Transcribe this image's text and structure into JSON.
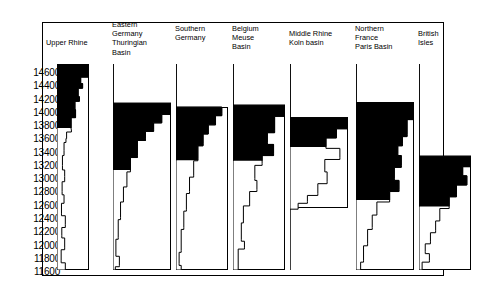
{
  "chart_data": {
    "type": "area",
    "title": "",
    "xlabel": "",
    "ylabel": "",
    "orientation": "vertical-columns",
    "y_axis": {
      "label": "",
      "unit": "calendar years BP",
      "direction": "descending-downwards",
      "ticks": [
        14600,
        14400,
        14200,
        14000,
        13800,
        13600,
        13400,
        13200,
        13000,
        12800,
        12600,
        12400,
        12200,
        12000,
        11800,
        11600
      ],
      "ylim": [
        14700,
        11550
      ],
      "grid": false
    },
    "legend": {
      "position": "none",
      "entries": []
    },
    "series": [
      {
        "name": "Upper Rhine",
        "label": "Upper Rhine",
        "profile": [
          {
            "y": 14700,
            "w": 1.0
          },
          {
            "y": 14560,
            "w": 1.0
          },
          {
            "y": 14500,
            "w": 0.74
          },
          {
            "y": 14400,
            "w": 0.8
          },
          {
            "y": 14330,
            "w": 0.66
          },
          {
            "y": 14200,
            "w": 0.7
          },
          {
            "y": 14130,
            "w": 0.56
          },
          {
            "y": 14000,
            "w": 0.58
          },
          {
            "y": 13880,
            "w": 0.44
          },
          {
            "y": 13700,
            "w": 0.45
          },
          {
            "y": 13660,
            "w": 0.3
          },
          {
            "y": 13560,
            "w": 0.28
          },
          {
            "y": 13500,
            "w": 0.22
          },
          {
            "y": 13380,
            "w": 0.22
          },
          {
            "y": 13300,
            "w": 0.17
          },
          {
            "y": 13150,
            "w": 0.17
          },
          {
            "y": 13080,
            "w": 0.24
          },
          {
            "y": 12980,
            "w": 0.24
          },
          {
            "y": 12900,
            "w": 0.16
          },
          {
            "y": 12750,
            "w": 0.16
          },
          {
            "y": 12700,
            "w": 0.22
          },
          {
            "y": 12620,
            "w": 0.22
          },
          {
            "y": 12570,
            "w": 0.14
          },
          {
            "y": 12420,
            "w": 0.14
          },
          {
            "y": 12380,
            "w": 0.26
          },
          {
            "y": 12250,
            "w": 0.26
          },
          {
            "y": 12200,
            "w": 0.15
          },
          {
            "y": 12080,
            "w": 0.15
          },
          {
            "y": 12040,
            "w": 0.24
          },
          {
            "y": 11900,
            "w": 0.24
          },
          {
            "y": 11860,
            "w": 0.13
          },
          {
            "y": 11700,
            "w": 0.13
          },
          {
            "y": 11660,
            "w": 0.26
          },
          {
            "y": 11550,
            "w": 0.26
          }
        ],
        "fill_above": 13720
      },
      {
        "name": "Eastern Germany Thuringian Basin",
        "label": "Eastern\nGermany\nThuringian\nBasin",
        "profile": [
          {
            "y": 14700,
            "w": 0.0
          },
          {
            "y": 14120,
            "w": 0.0
          },
          {
            "y": 14100,
            "w": 1.0
          },
          {
            "y": 13960,
            "w": 1.0
          },
          {
            "y": 13930,
            "w": 0.84
          },
          {
            "y": 13830,
            "w": 0.84
          },
          {
            "y": 13800,
            "w": 0.7
          },
          {
            "y": 13700,
            "w": 0.7
          },
          {
            "y": 13670,
            "w": 0.56
          },
          {
            "y": 13560,
            "w": 0.56
          },
          {
            "y": 13530,
            "w": 0.42
          },
          {
            "y": 13300,
            "w": 0.42
          },
          {
            "y": 13270,
            "w": 0.3
          },
          {
            "y": 13080,
            "w": 0.3
          },
          {
            "y": 13050,
            "w": 0.24
          },
          {
            "y": 12850,
            "w": 0.24
          },
          {
            "y": 12820,
            "w": 0.18
          },
          {
            "y": 12620,
            "w": 0.18
          },
          {
            "y": 12590,
            "w": 0.13
          },
          {
            "y": 12350,
            "w": 0.13
          },
          {
            "y": 12320,
            "w": 0.09
          },
          {
            "y": 12050,
            "w": 0.09
          },
          {
            "y": 12020,
            "w": 0.05
          },
          {
            "y": 11780,
            "w": 0.05
          },
          {
            "y": 11760,
            "w": 0.11
          },
          {
            "y": 11620,
            "w": 0.11
          },
          {
            "y": 11600,
            "w": 0.04
          },
          {
            "y": 11550,
            "w": 0.04
          }
        ],
        "fill_above": 13080
      },
      {
        "name": "Southern Germany",
        "label": "Southern\nGermany",
        "profile": [
          {
            "y": 14700,
            "w": 0.0
          },
          {
            "y": 14060,
            "w": 0.0
          },
          {
            "y": 14040,
            "w": 0.88
          },
          {
            "y": 13940,
            "w": 0.88
          },
          {
            "y": 13910,
            "w": 0.76
          },
          {
            "y": 13800,
            "w": 0.76
          },
          {
            "y": 13770,
            "w": 0.62
          },
          {
            "y": 13660,
            "w": 0.62
          },
          {
            "y": 13630,
            "w": 0.52
          },
          {
            "y": 13480,
            "w": 0.52
          },
          {
            "y": 13450,
            "w": 0.42
          },
          {
            "y": 13250,
            "w": 0.42
          },
          {
            "y": 13220,
            "w": 0.34
          },
          {
            "y": 13000,
            "w": 0.34
          },
          {
            "y": 12970,
            "w": 0.26
          },
          {
            "y": 12750,
            "w": 0.26
          },
          {
            "y": 12720,
            "w": 0.2
          },
          {
            "y": 12480,
            "w": 0.2
          },
          {
            "y": 12450,
            "w": 0.15
          },
          {
            "y": 12200,
            "w": 0.15
          },
          {
            "y": 12170,
            "w": 0.1
          },
          {
            "y": 11850,
            "w": 0.1
          },
          {
            "y": 11820,
            "w": 0.06
          },
          {
            "y": 11650,
            "w": 0.06
          },
          {
            "y": 11620,
            "w": 0.1
          },
          {
            "y": 11550,
            "w": 0.1
          }
        ],
        "fill_above": 13230
      },
      {
        "name": "Belgium Meuse Basin",
        "label": "Belgium\nMeuse\nBasin",
        "profile": [
          {
            "y": 14700,
            "w": 0.0
          },
          {
            "y": 14090,
            "w": 0.0
          },
          {
            "y": 14070,
            "w": 1.0
          },
          {
            "y": 13930,
            "w": 1.0
          },
          {
            "y": 13900,
            "w": 0.8
          },
          {
            "y": 13680,
            "w": 0.8
          },
          {
            "y": 13650,
            "w": 0.66
          },
          {
            "y": 13500,
            "w": 0.66
          },
          {
            "y": 13470,
            "w": 0.78
          },
          {
            "y": 13330,
            "w": 0.78
          },
          {
            "y": 13300,
            "w": 0.56
          },
          {
            "y": 13180,
            "w": 0.56
          },
          {
            "y": 13150,
            "w": 0.42
          },
          {
            "y": 12950,
            "w": 0.42
          },
          {
            "y": 12920,
            "w": 0.46
          },
          {
            "y": 12780,
            "w": 0.46
          },
          {
            "y": 12750,
            "w": 0.32
          },
          {
            "y": 12560,
            "w": 0.32
          },
          {
            "y": 12530,
            "w": 0.2
          },
          {
            "y": 12300,
            "w": 0.2
          },
          {
            "y": 12270,
            "w": 0.16
          },
          {
            "y": 12020,
            "w": 0.16
          },
          {
            "y": 11990,
            "w": 0.22
          },
          {
            "y": 11900,
            "w": 0.22
          },
          {
            "y": 11870,
            "w": 0.1
          },
          {
            "y": 11550,
            "w": 0.1
          }
        ],
        "fill_above": 13220
      },
      {
        "name": "Middle Rhine Koln basin",
        "label": "Middle Rhine\nKoln basin",
        "profile": [
          {
            "y": 14700,
            "w": 0.0
          },
          {
            "y": 13900,
            "w": 0.0
          },
          {
            "y": 13880,
            "w": 1.0
          },
          {
            "y": 13740,
            "w": 1.0
          },
          {
            "y": 13710,
            "w": 0.8
          },
          {
            "y": 13600,
            "w": 0.8
          },
          {
            "y": 13570,
            "w": 0.62
          },
          {
            "y": 13440,
            "w": 0.62
          },
          {
            "y": 13410,
            "w": 0.86
          },
          {
            "y": 13270,
            "w": 0.86
          },
          {
            "y": 13240,
            "w": 0.6
          },
          {
            "y": 13080,
            "w": 0.6
          },
          {
            "y": 13050,
            "w": 0.64
          },
          {
            "y": 12900,
            "w": 0.64
          },
          {
            "y": 12870,
            "w": 0.48
          },
          {
            "y": 12720,
            "w": 0.48
          },
          {
            "y": 12690,
            "w": 0.3
          },
          {
            "y": 12600,
            "w": 0.3
          },
          {
            "y": 12570,
            "w": 0.14
          },
          {
            "y": 12500,
            "w": 0.14
          },
          {
            "y": 12480,
            "w": 0.0
          },
          {
            "y": 11550,
            "w": 0.0
          }
        ],
        "fill_above": 13430
      },
      {
        "name": "Northern France Paris Basin",
        "label": "Northern\nFrance\nParis Basin",
        "profile": [
          {
            "y": 14700,
            "w": 0.0
          },
          {
            "y": 14130,
            "w": 0.0
          },
          {
            "y": 14110,
            "w": 1.0
          },
          {
            "y": 13880,
            "w": 1.0
          },
          {
            "y": 13850,
            "w": 0.88
          },
          {
            "y": 13620,
            "w": 0.88
          },
          {
            "y": 13590,
            "w": 0.8
          },
          {
            "y": 13480,
            "w": 0.8
          },
          {
            "y": 13450,
            "w": 0.72
          },
          {
            "y": 13330,
            "w": 0.72
          },
          {
            "y": 13300,
            "w": 0.78
          },
          {
            "y": 13150,
            "w": 0.78
          },
          {
            "y": 13120,
            "w": 0.66
          },
          {
            "y": 12950,
            "w": 0.66
          },
          {
            "y": 12920,
            "w": 0.74
          },
          {
            "y": 12780,
            "w": 0.74
          },
          {
            "y": 12750,
            "w": 0.58
          },
          {
            "y": 12620,
            "w": 0.58
          },
          {
            "y": 12590,
            "w": 0.36
          },
          {
            "y": 12420,
            "w": 0.36
          },
          {
            "y": 12390,
            "w": 0.28
          },
          {
            "y": 12200,
            "w": 0.28
          },
          {
            "y": 12170,
            "w": 0.2
          },
          {
            "y": 11950,
            "w": 0.2
          },
          {
            "y": 11920,
            "w": 0.13
          },
          {
            "y": 11700,
            "w": 0.13
          },
          {
            "y": 11670,
            "w": 0.08
          },
          {
            "y": 11550,
            "w": 0.08
          }
        ],
        "fill_above": 12620
      },
      {
        "name": "British Isles",
        "label": "British\nIsles",
        "profile": [
          {
            "y": 14700,
            "w": 0.0
          },
          {
            "y": 13310,
            "w": 0.0
          },
          {
            "y": 13290,
            "w": 1.0
          },
          {
            "y": 13160,
            "w": 1.0
          },
          {
            "y": 13130,
            "w": 0.84
          },
          {
            "y": 13020,
            "w": 0.84
          },
          {
            "y": 12990,
            "w": 0.92
          },
          {
            "y": 12880,
            "w": 0.92
          },
          {
            "y": 12850,
            "w": 0.72
          },
          {
            "y": 12700,
            "w": 0.72
          },
          {
            "y": 12670,
            "w": 0.58
          },
          {
            "y": 12520,
            "w": 0.58
          },
          {
            "y": 12490,
            "w": 0.4
          },
          {
            "y": 12330,
            "w": 0.4
          },
          {
            "y": 12300,
            "w": 0.32
          },
          {
            "y": 12150,
            "w": 0.32
          },
          {
            "y": 12120,
            "w": 0.22
          },
          {
            "y": 11980,
            "w": 0.22
          },
          {
            "y": 11950,
            "w": 0.12
          },
          {
            "y": 11830,
            "w": 0.12
          },
          {
            "y": 11800,
            "w": 0.2
          },
          {
            "y": 11700,
            "w": 0.2
          },
          {
            "y": 11670,
            "w": 0.06
          },
          {
            "y": 11550,
            "w": 0.06
          }
        ],
        "fill_above": 12520
      }
    ],
    "colors": {
      "fill": "#000000",
      "outline": "#000000",
      "background": "#ffffff"
    }
  },
  "layout": {
    "columns": [
      {
        "left": 57,
        "width": 32
      },
      {
        "left": 113,
        "width": 58
      },
      {
        "left": 176,
        "width": 52
      },
      {
        "left": 233,
        "width": 52
      },
      {
        "left": 290,
        "width": 58
      },
      {
        "left": 356,
        "width": 58
      },
      {
        "left": 419,
        "width": 52
      }
    ],
    "header_positions": [
      {
        "left": 46,
        "top": 38,
        "width": 62
      },
      {
        "left": 112,
        "top": 20,
        "width": 58
      },
      {
        "left": 175,
        "top": 24,
        "width": 56
      },
      {
        "left": 232,
        "top": 24,
        "width": 56
      },
      {
        "left": 289,
        "top": 29,
        "width": 66
      },
      {
        "left": 355,
        "top": 24,
        "width": 62
      },
      {
        "left": 418,
        "top": 29,
        "width": 50
      }
    ],
    "plot_top": 64,
    "plot_bottom": 270
  }
}
